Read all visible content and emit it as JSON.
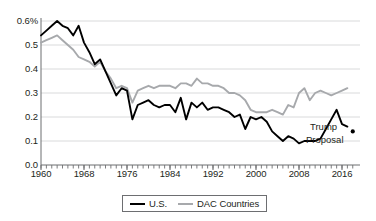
{
  "chart_data": {
    "type": "line",
    "title": "",
    "subtitle": "",
    "xlabel": "",
    "ylabel": "",
    "xlim": [
      1960,
      2017
    ],
    "ylim": [
      0.0,
      0.6
    ],
    "grid": "horizontal",
    "legend_position": "bottom-center",
    "y_tick_labels": [
      "0.0",
      "0.1",
      "0.2",
      "0.3",
      "0.4",
      "0.5",
      "0.6%"
    ],
    "y_ticks": [
      0.0,
      0.1,
      0.2,
      0.3,
      0.4,
      0.5,
      0.6
    ],
    "x_tick_labels": [
      "1960",
      "1968",
      "1976",
      "1984",
      "1992",
      "2000",
      "2008",
      "2016"
    ],
    "x_ticks": [
      1960,
      1968,
      1976,
      1984,
      1992,
      2000,
      2008,
      2016
    ],
    "x_minor_tick_step": 1,
    "colors": {
      "us": "#000000",
      "dac": "#a7a9ac",
      "grid": "#d9dadb",
      "axis": "#6d6e71",
      "text": "#231f20"
    },
    "x": [
      1960,
      1961,
      1962,
      1963,
      1964,
      1965,
      1966,
      1967,
      1968,
      1969,
      1970,
      1971,
      1972,
      1973,
      1974,
      1975,
      1976,
      1977,
      1978,
      1979,
      1980,
      1981,
      1982,
      1983,
      1984,
      1985,
      1986,
      1987,
      1988,
      1989,
      1990,
      1991,
      1992,
      1993,
      1994,
      1995,
      1996,
      1997,
      1998,
      1999,
      2000,
      2001,
      2002,
      2003,
      2004,
      2005,
      2006,
      2007,
      2008,
      2009,
      2010,
      2011,
      2012,
      2013,
      2014,
      2015,
      2016,
      2017
    ],
    "series": [
      {
        "name": "U.S.",
        "color": "#000000",
        "values": [
          0.54,
          0.56,
          0.58,
          0.6,
          0.58,
          0.57,
          0.54,
          0.58,
          0.51,
          0.47,
          0.42,
          0.44,
          0.39,
          0.34,
          0.29,
          0.32,
          0.31,
          0.19,
          0.25,
          0.26,
          0.27,
          0.25,
          0.24,
          0.25,
          0.25,
          0.22,
          0.28,
          0.19,
          0.26,
          0.24,
          0.26,
          0.23,
          0.24,
          0.24,
          0.23,
          0.22,
          0.2,
          0.21,
          0.15,
          0.2,
          0.19,
          0.2,
          0.18,
          0.14,
          0.12,
          0.1,
          0.12,
          0.11,
          0.09,
          0.1,
          0.1,
          0.1,
          0.11,
          0.15,
          0.19,
          0.23,
          0.17,
          0.16
        ],
        "annotated_points": [
          {
            "label": "Trump Proposal",
            "x": 2018,
            "y": 0.14
          }
        ]
      },
      {
        "name": "DAC Countries",
        "color": "#a7a9ac",
        "values": [
          0.51,
          0.52,
          0.53,
          0.54,
          0.52,
          0.5,
          0.48,
          0.45,
          0.44,
          0.43,
          0.41,
          0.43,
          0.39,
          0.36,
          0.32,
          0.33,
          0.32,
          0.26,
          0.31,
          0.32,
          0.33,
          0.32,
          0.33,
          0.33,
          0.33,
          0.32,
          0.34,
          0.34,
          0.33,
          0.36,
          0.34,
          0.34,
          0.33,
          0.33,
          0.32,
          0.3,
          0.3,
          0.29,
          0.27,
          0.23,
          0.22,
          0.22,
          0.22,
          0.23,
          0.22,
          0.21,
          0.25,
          0.24,
          0.3,
          0.32,
          0.27,
          0.3,
          0.31,
          0.3,
          0.29,
          0.3,
          0.31,
          0.32
        ],
        "annotated_points": []
      }
    ],
    "annotations": [
      {
        "name": "trump-proposal",
        "text_line1": "Trump",
        "text_line2": "Proposal",
        "x": 2018,
        "y": 0.14
      }
    ]
  },
  "legend": {
    "items": [
      {
        "label": "U.S.",
        "color": "#000000"
      },
      {
        "label": "DAC Countries",
        "color": "#a7a9ac"
      }
    ]
  }
}
